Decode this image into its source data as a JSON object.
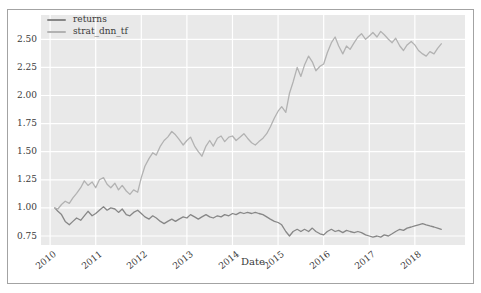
{
  "figure": {
    "xlabel": "Date",
    "colors": {
      "figure_background": "#ffffff",
      "frame_border": "#a3a3a3",
      "plot_background": "#e9e9e9",
      "gridline": "#ffffff",
      "text": "#3a3a3a"
    }
  },
  "chart_data": {
    "type": "line",
    "title": "",
    "xlabel": "Date",
    "ylabel": "",
    "grid": true,
    "legend_position": "upper left",
    "xlim": [
      2009.8,
      2019.1
    ],
    "ylim": [
      0.67,
      2.716
    ],
    "x_ticks": [
      2010,
      2011,
      2012,
      2013,
      2014,
      2015,
      2016,
      2017,
      2018
    ],
    "y_ticks": [
      0.75,
      1.0,
      1.25,
      1.5,
      1.75,
      2.0,
      2.25,
      2.5
    ],
    "y_tick_labels": [
      "0.75",
      "1.00",
      "1.25",
      "1.50",
      "1.75",
      "2.00",
      "2.25",
      "2.50"
    ],
    "series": [
      {
        "name": "returns",
        "color": "#878787",
        "points": [
          [
            2010.1,
            1.0
          ],
          [
            2010.17,
            0.97
          ],
          [
            2010.25,
            0.94
          ],
          [
            2010.33,
            0.88
          ],
          [
            2010.42,
            0.85
          ],
          [
            2010.5,
            0.88
          ],
          [
            2010.58,
            0.91
          ],
          [
            2010.67,
            0.89
          ],
          [
            2010.75,
            0.93
          ],
          [
            2010.83,
            0.97
          ],
          [
            2010.92,
            0.93
          ],
          [
            2011.0,
            0.95
          ],
          [
            2011.08,
            0.98
          ],
          [
            2011.17,
            1.01
          ],
          [
            2011.25,
            0.98
          ],
          [
            2011.33,
            1.0
          ],
          [
            2011.42,
            0.99
          ],
          [
            2011.5,
            0.96
          ],
          [
            2011.58,
            0.99
          ],
          [
            2011.67,
            0.94
          ],
          [
            2011.75,
            0.93
          ],
          [
            2011.83,
            0.96
          ],
          [
            2011.92,
            0.98
          ],
          [
            2012.0,
            0.95
          ],
          [
            2012.08,
            0.92
          ],
          [
            2012.17,
            0.9
          ],
          [
            2012.25,
            0.93
          ],
          [
            2012.33,
            0.91
          ],
          [
            2012.42,
            0.88
          ],
          [
            2012.5,
            0.86
          ],
          [
            2012.58,
            0.88
          ],
          [
            2012.67,
            0.9
          ],
          [
            2012.75,
            0.88
          ],
          [
            2012.83,
            0.9
          ],
          [
            2012.92,
            0.92
          ],
          [
            2013.0,
            0.91
          ],
          [
            2013.08,
            0.94
          ],
          [
            2013.17,
            0.92
          ],
          [
            2013.25,
            0.9
          ],
          [
            2013.33,
            0.92
          ],
          [
            2013.42,
            0.94
          ],
          [
            2013.5,
            0.92
          ],
          [
            2013.58,
            0.91
          ],
          [
            2013.67,
            0.93
          ],
          [
            2013.75,
            0.92
          ],
          [
            2013.83,
            0.94
          ],
          [
            2013.92,
            0.93
          ],
          [
            2014.0,
            0.95
          ],
          [
            2014.08,
            0.94
          ],
          [
            2014.17,
            0.96
          ],
          [
            2014.25,
            0.95
          ],
          [
            2014.33,
            0.96
          ],
          [
            2014.42,
            0.95
          ],
          [
            2014.5,
            0.96
          ],
          [
            2014.58,
            0.95
          ],
          [
            2014.67,
            0.94
          ],
          [
            2014.75,
            0.92
          ],
          [
            2014.83,
            0.9
          ],
          [
            2014.92,
            0.88
          ],
          [
            2015.0,
            0.87
          ],
          [
            2015.08,
            0.85
          ],
          [
            2015.17,
            0.79
          ],
          [
            2015.25,
            0.75
          ],
          [
            2015.33,
            0.79
          ],
          [
            2015.42,
            0.81
          ],
          [
            2015.5,
            0.79
          ],
          [
            2015.58,
            0.81
          ],
          [
            2015.67,
            0.79
          ],
          [
            2015.75,
            0.82
          ],
          [
            2015.83,
            0.79
          ],
          [
            2015.92,
            0.77
          ],
          [
            2016.0,
            0.76
          ],
          [
            2016.08,
            0.79
          ],
          [
            2016.17,
            0.81
          ],
          [
            2016.25,
            0.79
          ],
          [
            2016.33,
            0.8
          ],
          [
            2016.42,
            0.78
          ],
          [
            2016.5,
            0.8
          ],
          [
            2016.58,
            0.79
          ],
          [
            2016.67,
            0.78
          ],
          [
            2016.75,
            0.79
          ],
          [
            2016.83,
            0.78
          ],
          [
            2016.92,
            0.76
          ],
          [
            2017.0,
            0.75
          ],
          [
            2017.08,
            0.74
          ],
          [
            2017.17,
            0.75
          ],
          [
            2017.25,
            0.74
          ],
          [
            2017.33,
            0.76
          ],
          [
            2017.42,
            0.75
          ],
          [
            2017.5,
            0.77
          ],
          [
            2017.58,
            0.79
          ],
          [
            2017.67,
            0.81
          ],
          [
            2017.75,
            0.8
          ],
          [
            2017.83,
            0.82
          ],
          [
            2017.92,
            0.83
          ],
          [
            2018.0,
            0.84
          ],
          [
            2018.08,
            0.85
          ],
          [
            2018.17,
            0.86
          ],
          [
            2018.25,
            0.85
          ],
          [
            2018.33,
            0.84
          ],
          [
            2018.42,
            0.83
          ],
          [
            2018.5,
            0.82
          ],
          [
            2018.58,
            0.81
          ]
        ]
      },
      {
        "name": "strat_dnn_tf",
        "color": "#b2b2b2",
        "points": [
          [
            2010.1,
            1.0
          ],
          [
            2010.17,
            0.99
          ],
          [
            2010.25,
            1.03
          ],
          [
            2010.33,
            1.06
          ],
          [
            2010.42,
            1.04
          ],
          [
            2010.5,
            1.09
          ],
          [
            2010.58,
            1.13
          ],
          [
            2010.67,
            1.18
          ],
          [
            2010.75,
            1.24
          ],
          [
            2010.83,
            1.2
          ],
          [
            2010.92,
            1.23
          ],
          [
            2011.0,
            1.18
          ],
          [
            2011.08,
            1.25
          ],
          [
            2011.17,
            1.27
          ],
          [
            2011.25,
            1.21
          ],
          [
            2011.33,
            1.18
          ],
          [
            2011.42,
            1.22
          ],
          [
            2011.5,
            1.16
          ],
          [
            2011.58,
            1.2
          ],
          [
            2011.67,
            1.15
          ],
          [
            2011.75,
            1.12
          ],
          [
            2011.83,
            1.16
          ],
          [
            2011.92,
            1.14
          ],
          [
            2012.0,
            1.27
          ],
          [
            2012.08,
            1.37
          ],
          [
            2012.17,
            1.44
          ],
          [
            2012.25,
            1.49
          ],
          [
            2012.33,
            1.47
          ],
          [
            2012.42,
            1.55
          ],
          [
            2012.5,
            1.6
          ],
          [
            2012.58,
            1.63
          ],
          [
            2012.67,
            1.68
          ],
          [
            2012.75,
            1.65
          ],
          [
            2012.83,
            1.61
          ],
          [
            2012.92,
            1.56
          ],
          [
            2013.0,
            1.6
          ],
          [
            2013.08,
            1.63
          ],
          [
            2013.17,
            1.55
          ],
          [
            2013.25,
            1.5
          ],
          [
            2013.33,
            1.46
          ],
          [
            2013.42,
            1.55
          ],
          [
            2013.5,
            1.6
          ],
          [
            2013.58,
            1.55
          ],
          [
            2013.67,
            1.62
          ],
          [
            2013.75,
            1.64
          ],
          [
            2013.83,
            1.59
          ],
          [
            2013.92,
            1.63
          ],
          [
            2014.0,
            1.64
          ],
          [
            2014.08,
            1.6
          ],
          [
            2014.17,
            1.63
          ],
          [
            2014.25,
            1.66
          ],
          [
            2014.33,
            1.62
          ],
          [
            2014.42,
            1.58
          ],
          [
            2014.5,
            1.56
          ],
          [
            2014.58,
            1.59
          ],
          [
            2014.67,
            1.62
          ],
          [
            2014.75,
            1.66
          ],
          [
            2014.83,
            1.72
          ],
          [
            2014.92,
            1.8
          ],
          [
            2015.0,
            1.86
          ],
          [
            2015.08,
            1.9
          ],
          [
            2015.17,
            1.85
          ],
          [
            2015.25,
            2.02
          ],
          [
            2015.33,
            2.12
          ],
          [
            2015.42,
            2.25
          ],
          [
            2015.5,
            2.17
          ],
          [
            2015.58,
            2.27
          ],
          [
            2015.67,
            2.35
          ],
          [
            2015.75,
            2.3
          ],
          [
            2015.83,
            2.22
          ],
          [
            2015.92,
            2.26
          ],
          [
            2016.0,
            2.28
          ],
          [
            2016.08,
            2.38
          ],
          [
            2016.17,
            2.47
          ],
          [
            2016.25,
            2.52
          ],
          [
            2016.33,
            2.44
          ],
          [
            2016.42,
            2.37
          ],
          [
            2016.5,
            2.44
          ],
          [
            2016.58,
            2.41
          ],
          [
            2016.67,
            2.47
          ],
          [
            2016.75,
            2.52
          ],
          [
            2016.83,
            2.55
          ],
          [
            2016.92,
            2.5
          ],
          [
            2017.0,
            2.53
          ],
          [
            2017.08,
            2.56
          ],
          [
            2017.17,
            2.52
          ],
          [
            2017.25,
            2.57
          ],
          [
            2017.33,
            2.54
          ],
          [
            2017.42,
            2.5
          ],
          [
            2017.5,
            2.47
          ],
          [
            2017.58,
            2.51
          ],
          [
            2017.67,
            2.44
          ],
          [
            2017.75,
            2.4
          ],
          [
            2017.83,
            2.45
          ],
          [
            2017.92,
            2.48
          ],
          [
            2018.0,
            2.45
          ],
          [
            2018.08,
            2.4
          ],
          [
            2018.17,
            2.37
          ],
          [
            2018.25,
            2.35
          ],
          [
            2018.33,
            2.39
          ],
          [
            2018.42,
            2.37
          ],
          [
            2018.5,
            2.42
          ],
          [
            2018.58,
            2.46
          ]
        ]
      }
    ]
  }
}
